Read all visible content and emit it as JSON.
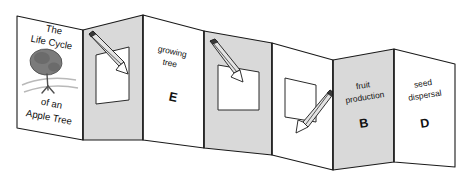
{
  "figure": {
    "name": "accordion-foldable-booklet",
    "colors": {
      "panel_white": "#ffffff",
      "panel_gray": "#d9d9d9",
      "outline": "#1a1a1a",
      "tree_canopy": "#7b7b7b",
      "ground_shadow": "#b9b9b9"
    }
  },
  "panels": [
    {
      "id": "cover",
      "shade": "white",
      "title_lines": [
        "The",
        "Life Cycle",
        "of an",
        "Apple Tree"
      ],
      "illustration": "apple-tree"
    },
    {
      "id": "panel-blank-1",
      "shade": "gray",
      "content": "cut-window-with-pencil",
      "label": "",
      "letter": ""
    },
    {
      "id": "panel-growing-tree",
      "shade": "white",
      "label_lines": [
        "growing",
        "tree"
      ],
      "letter": "E"
    },
    {
      "id": "panel-blank-2",
      "shade": "gray",
      "content": "cut-window-with-pencil",
      "label": "",
      "letter": ""
    },
    {
      "id": "panel-blank-3",
      "shade": "white",
      "content": "cut-window-with-pencil",
      "label": "",
      "letter": ""
    },
    {
      "id": "panel-fruit-production",
      "shade": "gray",
      "label_lines": [
        "fruit",
        "production"
      ],
      "letter": "B"
    },
    {
      "id": "panel-seed-dispersal",
      "shade": "white",
      "label_lines": [
        "seed",
        "dispersal"
      ],
      "letter": "D"
    }
  ],
  "text": {
    "cover_line1": "The",
    "cover_line2": "Life Cycle",
    "cover_line3": "of an",
    "cover_line4": "Apple Tree",
    "growing_line1": "growing",
    "growing_line2": "tree",
    "growing_letter": "E",
    "fruit_line1": "fruit",
    "fruit_line2": "production",
    "fruit_letter": "B",
    "seed_line1": "seed",
    "seed_line2": "dispersal",
    "seed_letter": "D"
  }
}
